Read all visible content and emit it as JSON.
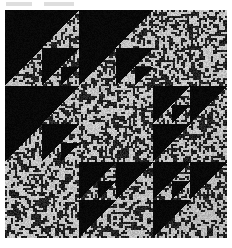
{
  "figure": {
    "kind": "binary-texture-mosaic",
    "background_color": "#ffffff",
    "ink_color": "#000000",
    "texture_mean_color": "#8a8a8a",
    "texture_dark_color": "#101010",
    "texture_light_color": "#f0f0f0",
    "page_margin_px": {
      "left": 5,
      "top": 10,
      "right": 5,
      "bottom": 10
    },
    "image_region_px": {
      "x": 5,
      "y": 10,
      "width": 222,
      "height": 228
    },
    "grid": {
      "rows": 3,
      "cols": 3,
      "cell_width": 74,
      "cell_height": 76
    },
    "recursion_depth": 3,
    "noise": {
      "cell_size_px": 2,
      "seed": 20240617,
      "black_probability": 0.48
    },
    "block_types": {
      "A": "black lower-left triangle, recursive sub-pattern in lower-right quadrant",
      "B": "black upper-left region with textured lower-right triangle, recursive sub-pattern in upper-left quadrant",
      "P": "plain noise texture, no triangles"
    },
    "cells": [
      {
        "row": 0,
        "col": 0,
        "type": "A",
        "name": "cell-r0c0"
      },
      {
        "row": 0,
        "col": 1,
        "type": "A",
        "name": "cell-r0c1"
      },
      {
        "row": 0,
        "col": 2,
        "type": "P",
        "name": "cell-r0c2"
      },
      {
        "row": 1,
        "col": 0,
        "type": "A",
        "name": "cell-r1c0"
      },
      {
        "row": 1,
        "col": 1,
        "type": "P",
        "name": "cell-r1c1"
      },
      {
        "row": 1,
        "col": 2,
        "type": "B",
        "name": "cell-r1c2"
      },
      {
        "row": 2,
        "col": 0,
        "type": "P",
        "name": "cell-r2c0"
      },
      {
        "row": 2,
        "col": 1,
        "type": "B",
        "name": "cell-r2c1"
      },
      {
        "row": 2,
        "col": 2,
        "type": "B",
        "name": "cell-r2c2"
      }
    ]
  }
}
